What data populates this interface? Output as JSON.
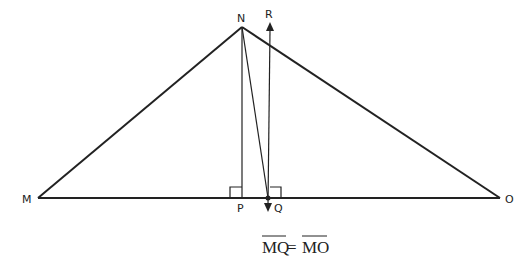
{
  "diagram": {
    "points": {
      "N": {
        "label": "N",
        "x": 242,
        "y": 27
      },
      "R": {
        "label": "R",
        "x": 270,
        "y": 22
      },
      "M": {
        "label": "M",
        "x": 38,
        "y": 198
      },
      "O": {
        "label": "O",
        "x": 500,
        "y": 198
      },
      "P": {
        "label": "P",
        "x": 242,
        "y": 198
      },
      "Q": {
        "label": "Q",
        "x": 268,
        "y": 198
      }
    },
    "labels": {
      "N": "N",
      "R": "R",
      "M": "M",
      "O": "O",
      "P": "P",
      "Q": "Q"
    },
    "equation": {
      "left": "MQ",
      "equals": "=",
      "right": "MO"
    },
    "colors": {
      "stroke": "#222222",
      "background": "#ffffff"
    }
  }
}
